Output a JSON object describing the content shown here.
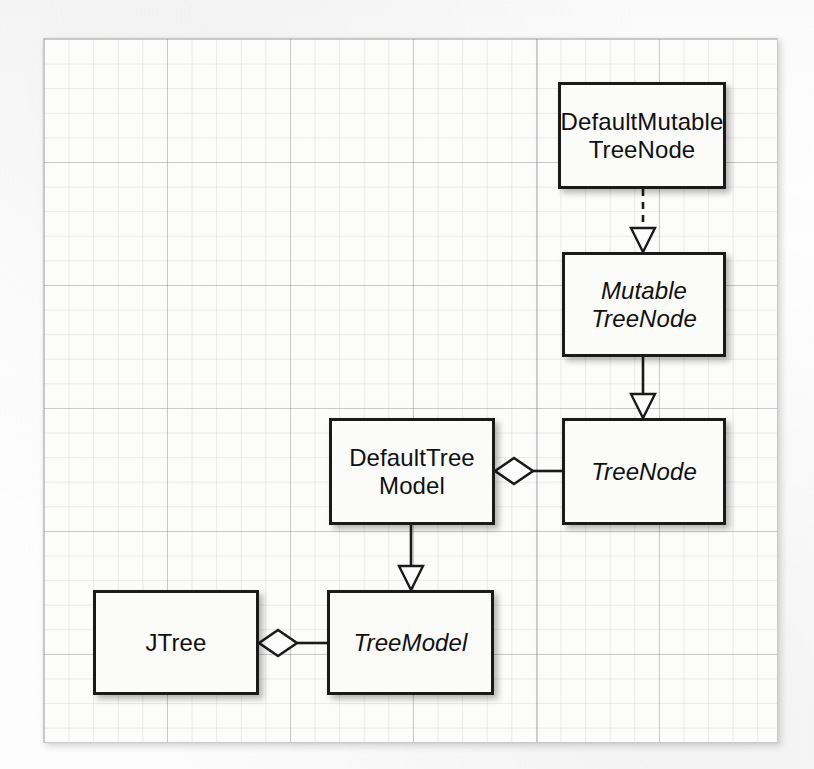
{
  "diagram": {
    "kind": "uml-class-diagram",
    "background": "#fcfcfb",
    "line_color": "#1a1a1a",
    "box_fill": "#fbfbfa",
    "grid_color": "#8c9196",
    "classes": [
      {
        "id": "defaultmutabletreenode",
        "label": "DefaultMutable\nTreeNode",
        "stereotype": "class",
        "abstract": false
      },
      {
        "id": "mutabletreenode",
        "label": "Mutable\nTreeNode",
        "stereotype": "interface",
        "abstract": true
      },
      {
        "id": "treenode",
        "label": "TreeNode",
        "stereotype": "interface",
        "abstract": true
      },
      {
        "id": "defaulttreemodel",
        "label": "DefaultTree\nModel",
        "stereotype": "class",
        "abstract": false
      },
      {
        "id": "treemodel",
        "label": "TreeModel",
        "stereotype": "interface",
        "abstract": true
      },
      {
        "id": "jtree",
        "label": "JTree",
        "stereotype": "class",
        "abstract": false
      }
    ],
    "relations": [
      {
        "id": "rel-dmtn-mtn",
        "from": "defaultmutabletreenode",
        "to": "mutabletreenode",
        "type": "realization",
        "line": "dashed",
        "head": "hollow-triangle"
      },
      {
        "id": "rel-mtn-tn",
        "from": "mutabletreenode",
        "to": "treenode",
        "type": "generalization",
        "line": "solid",
        "head": "hollow-triangle"
      },
      {
        "id": "rel-dtm-tn",
        "from": "defaulttreemodel",
        "to": "treenode",
        "type": "aggregation",
        "line": "solid",
        "head": "hollow-diamond"
      },
      {
        "id": "rel-dtm-tm",
        "from": "defaulttreemodel",
        "to": "treemodel",
        "type": "realization",
        "line": "solid",
        "head": "hollow-triangle"
      },
      {
        "id": "rel-jtree-tm",
        "from": "jtree",
        "to": "treemodel",
        "type": "aggregation",
        "line": "solid",
        "head": "hollow-diamond"
      }
    ]
  }
}
